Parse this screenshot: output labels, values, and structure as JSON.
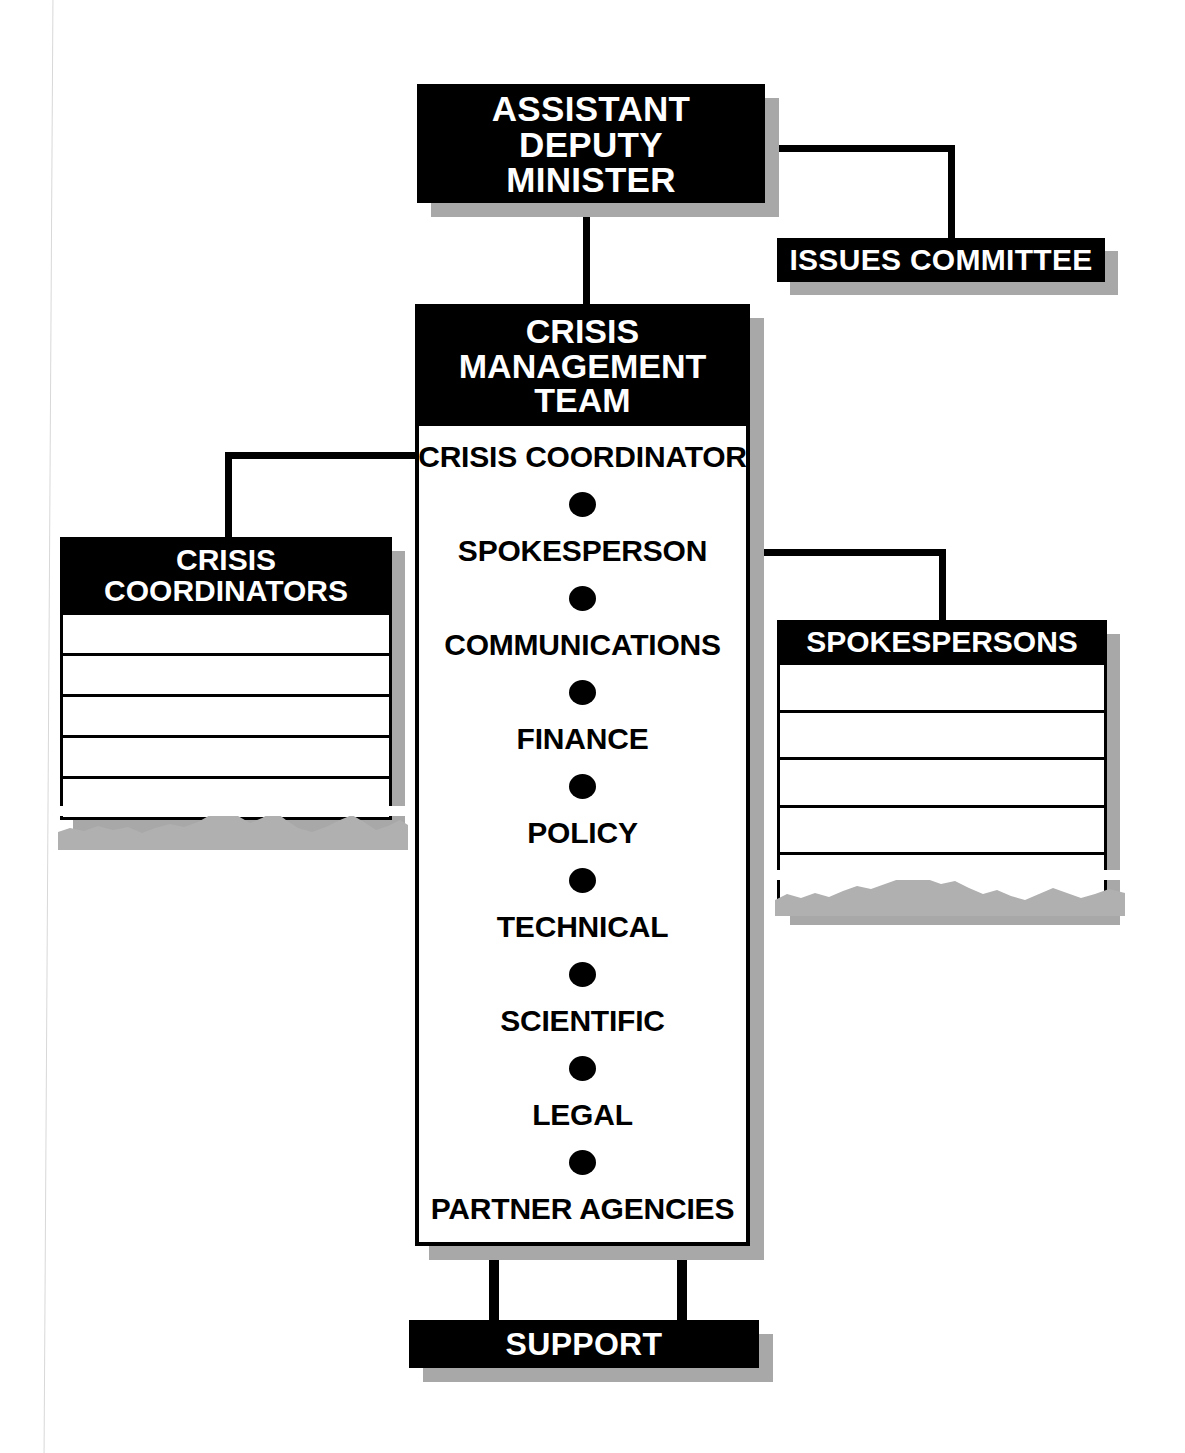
{
  "diagram": {
    "colors": {
      "box_fill": "#000000",
      "box_text": "#ffffff",
      "body_fill": "#ffffff",
      "body_text": "#000000",
      "shadow": "#a8a8a8",
      "line": "#000000"
    },
    "top": {
      "label": "ASSISTANT\nDEPUTY\nMINISTER",
      "line1": "ASSISTANT",
      "line2": "DEPUTY",
      "line3": "MINISTER"
    },
    "issues_committee": {
      "label": "ISSUES COMMITTEE"
    },
    "crisis_management_team": {
      "header_line1": "CRISIS",
      "header_line2": "MANAGEMENT",
      "header_line3": "TEAM",
      "members": [
        "CRISIS COORDINATOR",
        "SPOKESPERSON",
        "COMMUNICATIONS",
        "FINANCE",
        "POLICY",
        "TECHNICAL",
        "SCIENTIFIC",
        "LEGAL",
        "PARTNER AGENCIES"
      ],
      "separator_icon": "bullet-dot"
    },
    "crisis_coordinators": {
      "header_line1": "CRISIS",
      "header_line2": "COORDINATORS",
      "rows": [
        "",
        "",
        "",
        "",
        ""
      ],
      "row_count": 5,
      "bottom_edge": "torn"
    },
    "spokespersons": {
      "header": "SPOKESPERSONS",
      "rows": [
        "",
        "",
        "",
        "",
        ""
      ],
      "row_count": 5,
      "bottom_edge": "torn"
    },
    "support": {
      "label": "SUPPORT"
    },
    "connectors": [
      "assistant-deputy-minister-to-issues-committee",
      "assistant-deputy-minister-to-crisis-management-team",
      "crisis-coordinator-to-crisis-coordinators-list",
      "spokesperson-to-spokespersons-list",
      "crisis-management-team-to-support-left",
      "crisis-management-team-to-support-right"
    ]
  }
}
